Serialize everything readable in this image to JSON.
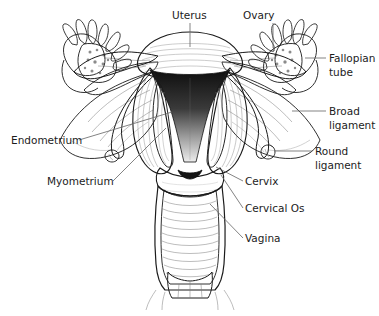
{
  "figure": {
    "background": "#ffffff",
    "line_color": "#1a1a1a",
    "leader_color": "#6d6d6d",
    "text_color": "#1c1c1c"
  },
  "labels": [
    {
      "id": "uterus",
      "text": "Uterus",
      "x": 172,
      "y": 19,
      "anchor": "start"
    },
    {
      "id": "ovary",
      "text": "Ovary",
      "x": 243,
      "y": 19,
      "anchor": "start"
    },
    {
      "id": "fallopian-tube-1",
      "text": "Fallopian",
      "x": 329,
      "y": 62,
      "anchor": "start"
    },
    {
      "id": "fallopian-tube-2",
      "text": "tube",
      "x": 329,
      "y": 76,
      "anchor": "start"
    },
    {
      "id": "broad-ligament-1",
      "text": "Broad",
      "x": 329,
      "y": 115,
      "anchor": "start"
    },
    {
      "id": "broad-ligament-2",
      "text": "ligament",
      "x": 329,
      "y": 129,
      "anchor": "start"
    },
    {
      "id": "round-ligament-1",
      "text": "Round",
      "x": 315,
      "y": 155,
      "anchor": "start"
    },
    {
      "id": "round-ligament-2",
      "text": "ligament",
      "x": 315,
      "y": 169,
      "anchor": "start"
    },
    {
      "id": "endometrium",
      "text": "Endometrium",
      "x": 11,
      "y": 144,
      "anchor": "start"
    },
    {
      "id": "myometrium",
      "text": "Myometrium",
      "x": 47,
      "y": 185,
      "anchor": "start"
    },
    {
      "id": "cervix",
      "text": "Cervix",
      "x": 245,
      "y": 185,
      "anchor": "start"
    },
    {
      "id": "cervical-os",
      "text": "Cervical Os",
      "x": 245,
      "y": 212,
      "anchor": "start"
    },
    {
      "id": "vagina",
      "text": "Vagina",
      "x": 245,
      "y": 242,
      "anchor": "start"
    }
  ],
  "leader_lines": [
    {
      "id": "leader-uterus",
      "d": "M 190 23 L 190 47"
    },
    {
      "id": "leader-ovary",
      "d": "M 273 23 L 273 48"
    },
    {
      "id": "leader-fallopian-tube",
      "d": "M 326 58 L 305 58"
    },
    {
      "id": "leader-broad-ligament",
      "d": "M 326 111 L 292 111"
    },
    {
      "id": "leader-round-ligament",
      "d": "M 312 151 L 274 151"
    },
    {
      "id": "leader-endometrium",
      "d": "M 79 140 L 172 112"
    },
    {
      "id": "leader-myometrium",
      "d": "M 113 181 L 166 128"
    },
    {
      "id": "leader-cervix",
      "d": "M 243 181 L 216 167"
    },
    {
      "id": "leader-cervical-os",
      "d": "M 243 208 L 221 175"
    },
    {
      "id": "leader-vagina",
      "d": "M 243 238 L 210 204"
    }
  ],
  "anatomy_parts": [
    {
      "id": "uterine-fundus",
      "name": "uterine fundus"
    },
    {
      "id": "uterine-cavity",
      "name": "uterine cavity"
    },
    {
      "id": "endometrium",
      "name": "endometrium"
    },
    {
      "id": "myometrium",
      "name": "myometrium"
    },
    {
      "id": "cervix",
      "name": "cervix"
    },
    {
      "id": "cervical-os",
      "name": "cervical os"
    },
    {
      "id": "vaginal-canal",
      "name": "vaginal canal"
    },
    {
      "id": "vaginal-rugae",
      "name": "vaginal rugae"
    },
    {
      "id": "left-ovary",
      "name": "left ovary"
    },
    {
      "id": "right-ovary",
      "name": "right ovary"
    },
    {
      "id": "left-fimbriae",
      "name": "left fimbriae"
    },
    {
      "id": "right-fimbriae",
      "name": "right fimbriae"
    },
    {
      "id": "left-fallopian-tube",
      "name": "left fallopian tube"
    },
    {
      "id": "right-fallopian-tube",
      "name": "right fallopian tube"
    },
    {
      "id": "left-broad-ligament",
      "name": "left broad ligament"
    },
    {
      "id": "right-broad-ligament",
      "name": "right broad ligament"
    },
    {
      "id": "left-round-ligament",
      "name": "left round ligament"
    },
    {
      "id": "right-round-ligament",
      "name": "right round ligament"
    }
  ]
}
